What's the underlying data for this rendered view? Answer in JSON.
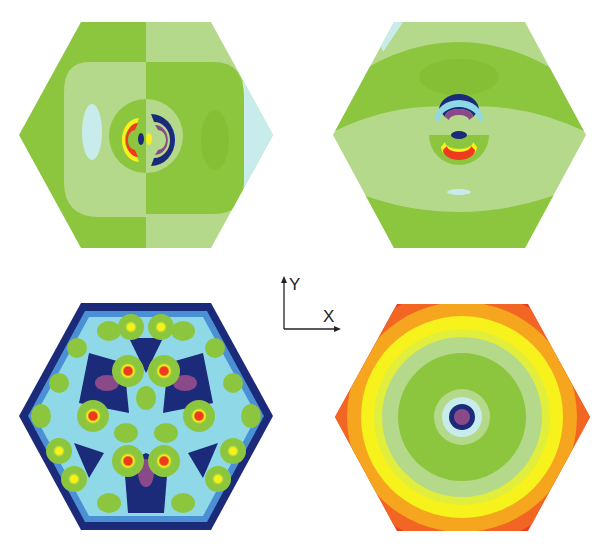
{
  "figure": {
    "axes": {
      "y_label": "Y",
      "x_label": "X"
    },
    "panels": [
      {
        "id": "top-left",
        "pattern": "dipole along X, red lobe left, blue lobe right"
      },
      {
        "id": "top-right",
        "pattern": "dipole along Y, blue lobe top, red lobe bottom"
      },
      {
        "id": "bottom-left",
        "pattern": "hexagonal lattice of hotspots"
      },
      {
        "id": "bottom-right",
        "pattern": "concentric rings, minimum at center"
      }
    ],
    "colors": {
      "green": "#8cc63f",
      "light_green": "#b5d98a",
      "pale_cyan": "#c8ecec",
      "cyan": "#8fd8e8",
      "blue": "#4b8fd4",
      "navy": "#1c2a7a",
      "purple": "#8a4a8a",
      "yellow": "#f7f21c",
      "orange": "#f5a51e",
      "red": "#ee3b1f",
      "deep_orange": "#f26522"
    }
  }
}
